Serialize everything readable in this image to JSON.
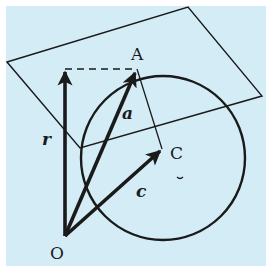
{
  "figure": {
    "background": "#d3ecf5",
    "ink": "#1a1a1a",
    "labels": {
      "point_A": "A",
      "point_C": "C",
      "point_O": "O",
      "vector_r": "r",
      "vector_a": "a",
      "vector_c": "c"
    },
    "elements": [
      {
        "kind": "plane",
        "description": "parallelogram plane"
      },
      {
        "kind": "circle",
        "description": "circle centered near C"
      },
      {
        "kind": "vector",
        "name": "r",
        "from": "O",
        "direction": "vertical up"
      },
      {
        "kind": "vector",
        "name": "a",
        "from": "O",
        "to": "A"
      },
      {
        "kind": "vector",
        "name": "c",
        "from": "O",
        "to": "C"
      },
      {
        "kind": "segment",
        "from": "A",
        "to": "C"
      },
      {
        "kind": "dashed-segment",
        "from": "tip of r",
        "to": "A"
      }
    ]
  }
}
